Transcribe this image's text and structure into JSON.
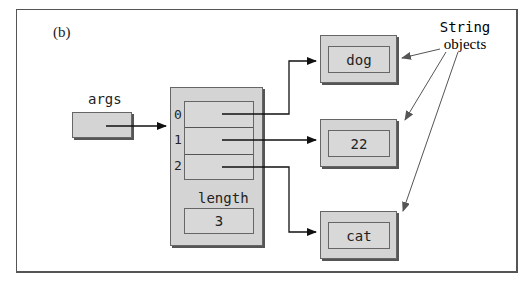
{
  "panel_label": "(b)",
  "variable": {
    "name": "args"
  },
  "array": {
    "indices": [
      "0",
      "1",
      "2"
    ],
    "length_label": "length",
    "length_value": "3"
  },
  "string_objects": [
    {
      "value": "dog"
    },
    {
      "value": "22"
    },
    {
      "value": "cat"
    }
  ],
  "annotation": {
    "line1": "String",
    "line2": "objects"
  }
}
